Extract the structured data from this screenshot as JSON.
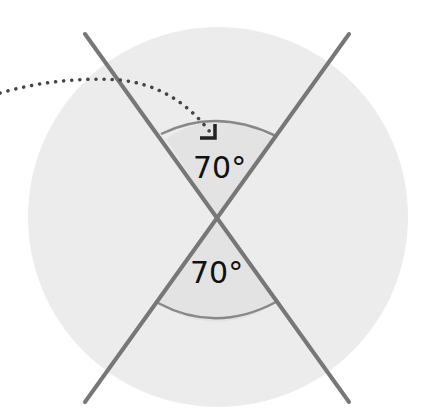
{
  "diagram": {
    "angles": [
      {
        "id": "top",
        "label": "70°",
        "value": 70
      },
      {
        "id": "bottom",
        "label": "70°",
        "value": 70
      }
    ],
    "colors": {
      "background_circle": "#ececec",
      "lines": "#777777",
      "arc": "#888888",
      "sector_fill": "#e3e3e3",
      "dotted_arrow": "#444444",
      "text": "#111111"
    }
  }
}
